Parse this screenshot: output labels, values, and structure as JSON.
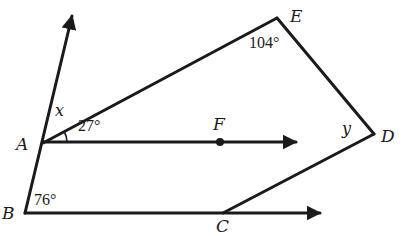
{
  "diagram": {
    "points": {
      "A": {
        "label": "A",
        "x": 43,
        "y": 143
      },
      "B": {
        "label": "B",
        "x": 25,
        "y": 213
      },
      "C": {
        "label": "C",
        "x": 223,
        "y": 213
      },
      "D": {
        "label": "D",
        "x": 374,
        "y": 134
      },
      "E": {
        "label": "E",
        "x": 277,
        "y": 18
      },
      "F": {
        "label": "F",
        "x": 220,
        "y": 142
      }
    },
    "angles": {
      "x": "x",
      "y": "y",
      "angle_EAF": "27°",
      "angle_E": "104°",
      "angle_B": "76°"
    },
    "colors": {
      "ink": "#1a1a1a",
      "background": "#ffffff"
    }
  }
}
